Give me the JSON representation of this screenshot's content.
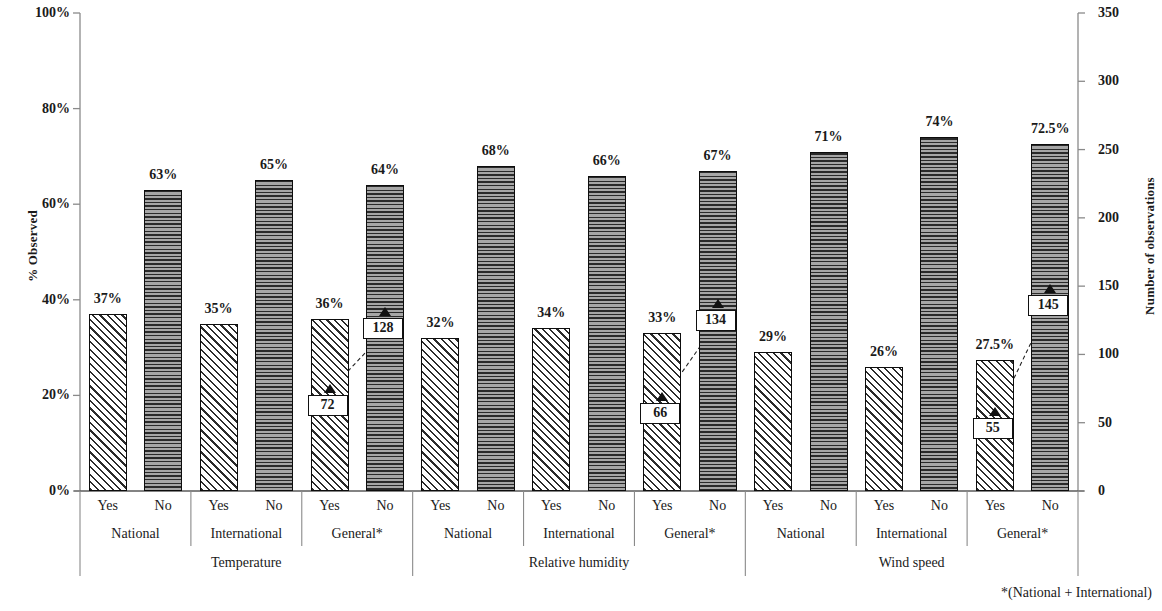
{
  "chart_data": {
    "type": "bar",
    "title": "",
    "ylabel": "% Observed",
    "y2label": "Number of observations",
    "xlabel": "",
    "ylim": [
      0,
      100
    ],
    "y2lim": [
      0,
      350
    ],
    "yticks": [
      "0%",
      "20%",
      "40%",
      "60%",
      "80%",
      "100%"
    ],
    "ytick_values": [
      0,
      20,
      40,
      60,
      80,
      100
    ],
    "y2ticks": [
      "0",
      "50",
      "100",
      "150",
      "200",
      "250",
      "300",
      "350"
    ],
    "y2tick_values": [
      0,
      50,
      100,
      150,
      200,
      250,
      300,
      350
    ],
    "grid": false,
    "legend": "none",
    "footnote": "*(National + International)",
    "groups": [
      {
        "name": "Temperature",
        "subgroups": [
          {
            "name": "National",
            "bars": [
              {
                "answer": "Yes",
                "percent": 37,
                "label": "37%",
                "pattern": "diagonal-hatch"
              },
              {
                "answer": "No",
                "percent": 63,
                "label": "63%",
                "pattern": "horizontal-lines"
              }
            ]
          },
          {
            "name": "International",
            "bars": [
              {
                "answer": "Yes",
                "percent": 35,
                "label": "35%",
                "pattern": "diagonal-hatch"
              },
              {
                "answer": "No",
                "percent": 65,
                "label": "65%",
                "pattern": "horizontal-lines"
              }
            ]
          },
          {
            "name": "General*",
            "bars": [
              {
                "answer": "Yes",
                "percent": 36,
                "label": "36%",
                "pattern": "diagonal-hatch",
                "observations": 72,
                "observations_label": "72"
              },
              {
                "answer": "No",
                "percent": 64,
                "label": "64%",
                "pattern": "horizontal-lines",
                "observations": 128,
                "observations_label": "128"
              }
            ]
          }
        ]
      },
      {
        "name": "Relative humidity",
        "subgroups": [
          {
            "name": "National",
            "bars": [
              {
                "answer": "Yes",
                "percent": 32,
                "label": "32%",
                "pattern": "diagonal-hatch"
              },
              {
                "answer": "No",
                "percent": 68,
                "label": "68%",
                "pattern": "horizontal-lines"
              }
            ]
          },
          {
            "name": "International",
            "bars": [
              {
                "answer": "Yes",
                "percent": 34,
                "label": "34%",
                "pattern": "diagonal-hatch"
              },
              {
                "answer": "No",
                "percent": 66,
                "label": "66%",
                "pattern": "horizontal-lines"
              }
            ]
          },
          {
            "name": "General*",
            "bars": [
              {
                "answer": "Yes",
                "percent": 33,
                "label": "33%",
                "pattern": "diagonal-hatch",
                "observations": 66,
                "observations_label": "66"
              },
              {
                "answer": "No",
                "percent": 67,
                "label": "67%",
                "pattern": "horizontal-lines",
                "observations": 134,
                "observations_label": "134"
              }
            ]
          }
        ]
      },
      {
        "name": "Wind speed",
        "subgroups": [
          {
            "name": "National",
            "bars": [
              {
                "answer": "Yes",
                "percent": 29,
                "label": "29%",
                "pattern": "diagonal-hatch"
              },
              {
                "answer": "No",
                "percent": 71,
                "label": "71%",
                "pattern": "horizontal-lines"
              }
            ]
          },
          {
            "name": "International",
            "bars": [
              {
                "answer": "Yes",
                "percent": 26,
                "label": "26%",
                "pattern": "diagonal-hatch"
              },
              {
                "answer": "No",
                "percent": 74,
                "label": "74%",
                "pattern": "horizontal-lines"
              }
            ]
          },
          {
            "name": "General*",
            "bars": [
              {
                "answer": "Yes",
                "percent": 27.5,
                "label": "27.5%",
                "pattern": "diagonal-hatch",
                "observations": 55,
                "observations_label": "55"
              },
              {
                "answer": "No",
                "percent": 72.5,
                "label": "72.5%",
                "pattern": "horizontal-lines",
                "observations": 145,
                "observations_label": "145"
              }
            ]
          }
        ]
      }
    ]
  }
}
